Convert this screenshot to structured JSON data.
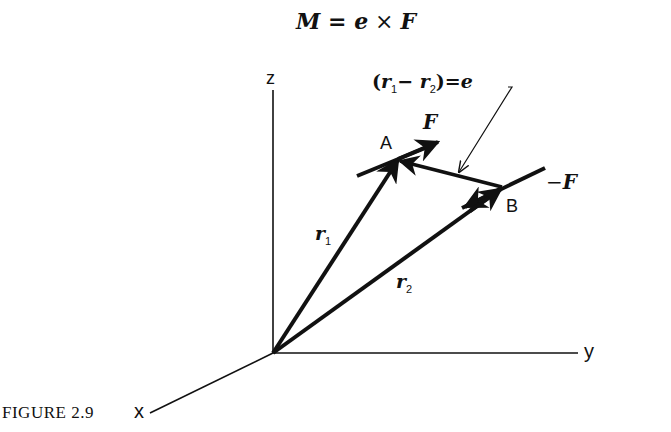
{
  "equation": {
    "M": "M",
    "equals": " = ",
    "e": "e",
    "times": " × ",
    "F": "F"
  },
  "annotation": {
    "open": "(",
    "r1": "r",
    "r1_sub": "1",
    "minus": "− ",
    "r2": "r",
    "r2_sub": "2",
    "close": ")",
    "equals": "=",
    "e": "e"
  },
  "axes": {
    "z": "z",
    "y": "y",
    "x": "x"
  },
  "points": {
    "A": "A",
    "B": "B"
  },
  "vectors": {
    "F": "F",
    "neg_F_sign": "−",
    "neg_F": "F",
    "r1": "r",
    "r1_sub": "1",
    "r2": "r",
    "r2_sub": "2"
  },
  "caption": "FIGURE 2.9",
  "colors": {
    "ink": "#111111",
    "background": "#ffffff"
  }
}
